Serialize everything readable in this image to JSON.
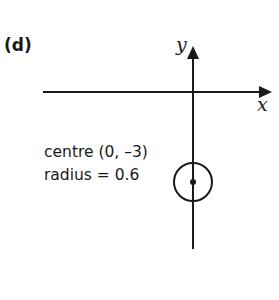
{
  "figure": {
    "part_label": "(d)",
    "axes": {
      "x_label": "x",
      "y_label": "y"
    },
    "annotation": {
      "line1": "centre (0, –3)",
      "line2": "radius = 0.6"
    },
    "circle": {
      "centre": [
        0,
        -3
      ],
      "radius": 0.6
    },
    "colors": {
      "ink": "#1a1a1a",
      "background": "#ffffff"
    }
  }
}
